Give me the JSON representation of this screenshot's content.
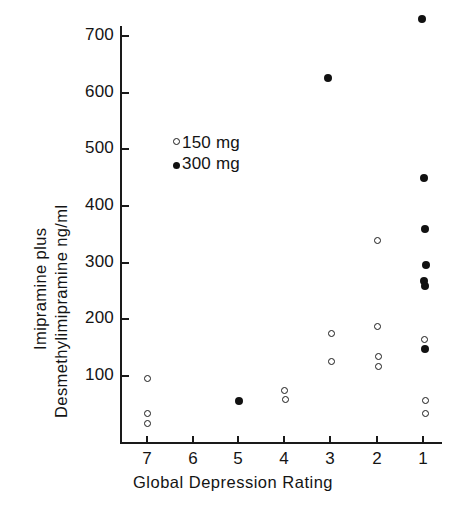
{
  "chart_data": {
    "type": "scatter",
    "title": "",
    "xlabel": "Global Depression Rating",
    "ylabel_line1": "Imipramine plus",
    "ylabel_line2": "Desmethylimipramine  ng/ml",
    "grid": false,
    "xlim": [
      7.5,
      0.5
    ],
    "ylim": [
      0,
      740
    ],
    "x_ticks": [
      "7",
      "6",
      "5",
      "4",
      "3",
      "2",
      "1"
    ],
    "x_tick_values": [
      7,
      6,
      5,
      4,
      3,
      2,
      1
    ],
    "y_ticks": [
      "100",
      "200",
      "300",
      "400",
      "500",
      "600",
      "700"
    ],
    "y_tick_values": [
      100,
      200,
      300,
      400,
      500,
      600,
      700
    ],
    "x_axis_inverted": true,
    "legend": {
      "position": "upper-left-inside",
      "entries": [
        {
          "label": "150 mg",
          "marker": "open-circle"
        },
        {
          "label": "300 mg",
          "marker": "filled-circle"
        }
      ]
    },
    "series": [
      {
        "name": "150 mg",
        "marker": "open-circle",
        "points": [
          {
            "x": 7,
            "y": 95
          },
          {
            "x": 7,
            "y": 33
          },
          {
            "x": 7,
            "y": 17
          },
          {
            "x": 4,
            "y": 74
          },
          {
            "x": 4,
            "y": 58
          },
          {
            "x": 3,
            "y": 175
          },
          {
            "x": 3,
            "y": 126
          },
          {
            "x": 2,
            "y": 339
          },
          {
            "x": 2,
            "y": 188
          },
          {
            "x": 2,
            "y": 135
          },
          {
            "x": 2,
            "y": 116
          },
          {
            "x": 1,
            "y": 165
          },
          {
            "x": 1,
            "y": 56
          },
          {
            "x": 1,
            "y": 33
          }
        ]
      },
      {
        "name": "300 mg",
        "marker": "filled-circle",
        "points": [
          {
            "x": 5,
            "y": 56
          },
          {
            "x": 3,
            "y": 625
          },
          {
            "x": 1,
            "y": 729
          },
          {
            "x": 1,
            "y": 450
          },
          {
            "x": 1,
            "y": 359
          },
          {
            "x": 1,
            "y": 296
          },
          {
            "x": 1,
            "y": 268
          },
          {
            "x": 1,
            "y": 259
          },
          {
            "x": 1,
            "y": 148
          }
        ]
      }
    ],
    "colors": {
      "axis": "#1a1a1a",
      "marker": "#111111",
      "background": "#ffffff"
    }
  },
  "geometry": {
    "x_px": {
      "7": 147,
      "6": 193,
      "5": 238,
      "4": 284,
      "3": 330,
      "2": 377,
      "1": 423
    },
    "y_base_px": 376,
    "y_base_value": 100,
    "px_per_unit": 0.567
  }
}
